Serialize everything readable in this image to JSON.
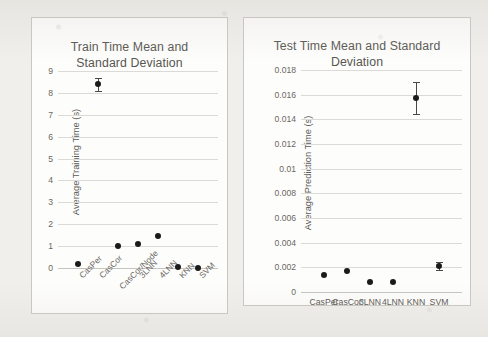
{
  "chart_data": [
    {
      "type": "scatter",
      "title": "Train Time Mean and Standard Deviation",
      "xlabel": "",
      "ylabel": "Average Training Time (s)",
      "categories": [
        "CasPer",
        "CasCor",
        "CasCor/Node",
        "3LNN",
        "4LNN",
        "KNN",
        "SVM"
      ],
      "values": [
        0.2,
        8.4,
        1.0,
        1.1,
        1.45,
        0.03,
        0.02
      ],
      "errors": [
        0.05,
        0.3,
        0.05,
        0.05,
        0.05,
        0.02,
        0.02
      ],
      "ylim": [
        0,
        9
      ],
      "yticks": [
        "0",
        "1",
        "2",
        "3",
        "4",
        "5",
        "6",
        "7",
        "8",
        "9"
      ],
      "grid": true,
      "legend": "none",
      "xtick_rotation": -45
    },
    {
      "type": "scatter",
      "title": "Test Time Mean and Standard Deviation",
      "xlabel": "",
      "ylabel": "Average Prediction Time (s)",
      "categories": [
        "CasPer",
        "CasCor",
        "3LNN",
        "4LNN",
        "KNN",
        "SVM"
      ],
      "values": [
        0.0014,
        0.0017,
        0.0008,
        0.0008,
        0.0157,
        0.0021
      ],
      "errors": [
        0.0001,
        0.0001,
        0.0001,
        0.0001,
        0.0013,
        0.0003
      ],
      "ylim": [
        0,
        0.018
      ],
      "yticks": [
        "0",
        "0.002",
        "0.004",
        "0.006",
        "0.008",
        "0.01",
        "0.012",
        "0.014",
        "0.016",
        "0.018"
      ],
      "grid": true,
      "legend": "none",
      "xtick_rotation": 0
    }
  ],
  "figure": {
    "left_panel": {
      "title_line1": "Train Time Mean and",
      "title_line2": "Standard Deviation",
      "ylabel": "Average Training Time (s)"
    },
    "right_panel": {
      "title_line1": "Test Time Mean and Standard",
      "title_line2": "Deviation",
      "ylabel": "Average Prediction Time (s)"
    },
    "colors": {
      "marker": "#1b1b1b",
      "gridline": "#dcdad6",
      "panel_background": "#fdfdfc",
      "page_background": "#f0efec",
      "title_text": "#585651"
    }
  }
}
